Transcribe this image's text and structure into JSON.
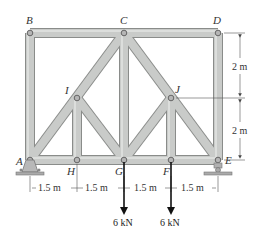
{
  "figure": {
    "type": "truss",
    "joints": {
      "A": {
        "label": "A",
        "x": 30,
        "y": 160
      },
      "B": {
        "label": "B",
        "x": 30,
        "y": 33
      },
      "C": {
        "label": "C",
        "x": 124,
        "y": 33
      },
      "D": {
        "label": "D",
        "x": 218,
        "y": 33
      },
      "E": {
        "label": "E",
        "x": 218,
        "y": 160
      },
      "F": {
        "label": "F",
        "x": 171,
        "y": 160
      },
      "G": {
        "label": "G",
        "x": 124,
        "y": 160
      },
      "H": {
        "label": "H",
        "x": 77,
        "y": 160
      },
      "I": {
        "label": "I",
        "x": 77,
        "y": 98
      },
      "J": {
        "label": "J",
        "x": 171,
        "y": 98
      }
    },
    "members": [
      [
        "B",
        "C"
      ],
      [
        "C",
        "D"
      ],
      [
        "A",
        "B"
      ],
      [
        "D",
        "E"
      ],
      [
        "A",
        "H"
      ],
      [
        "H",
        "G"
      ],
      [
        "G",
        "F"
      ],
      [
        "F",
        "E"
      ],
      [
        "C",
        "G"
      ],
      [
        "C",
        "I"
      ],
      [
        "I",
        "A"
      ],
      [
        "I",
        "H"
      ],
      [
        "I",
        "G"
      ],
      [
        "C",
        "J"
      ],
      [
        "J",
        "E"
      ],
      [
        "J",
        "F"
      ],
      [
        "J",
        "G"
      ]
    ],
    "dimensions": {
      "vertical": [
        {
          "label": "2 m",
          "from": "D",
          "to": "J"
        },
        {
          "label": "2 m",
          "from": "J",
          "to": "E"
        }
      ],
      "horizontal": [
        {
          "label": "1.5 m",
          "from": "A",
          "to": "H"
        },
        {
          "label": "1.5 m",
          "from": "H",
          "to": "G"
        },
        {
          "label": "1.5 m",
          "from": "G",
          "to": "F"
        },
        {
          "label": "1.5 m",
          "from": "F",
          "to": "E"
        }
      ]
    },
    "loads": [
      {
        "joint": "G",
        "label": "6 kN",
        "direction": "down"
      },
      {
        "joint": "F",
        "label": "6 kN",
        "direction": "down"
      }
    ],
    "supports": {
      "A": "pin",
      "E": "roller"
    },
    "colors": {
      "member_fill": "#c9cbc9",
      "member_edge": "#8a8c8a",
      "pin": "#9a9a9a",
      "text": "#333333",
      "arrow": "#111111"
    }
  }
}
